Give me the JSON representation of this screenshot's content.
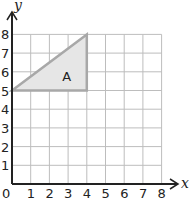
{
  "diagram": {
    "type": "coordinate-grid",
    "x_axis": {
      "label": "x",
      "ticks": [
        "1",
        "2",
        "3",
        "4",
        "5",
        "6",
        "7",
        "8"
      ],
      "min": 0,
      "max": 8
    },
    "y_axis": {
      "label": "y",
      "ticks": [
        "1",
        "2",
        "3",
        "4",
        "5",
        "6",
        "7",
        "8"
      ],
      "min": 0,
      "max": 8
    },
    "origin_label": "0",
    "shape": {
      "label": "A",
      "kind": "right-triangle",
      "vertices": [
        [
          0,
          5
        ],
        [
          4,
          8
        ],
        [
          4,
          5
        ]
      ],
      "fill": "#e6e6e6",
      "stroke": "#a8a8a8"
    },
    "colors": {
      "grid": "#bdbdbd",
      "axis": "#222222"
    }
  }
}
